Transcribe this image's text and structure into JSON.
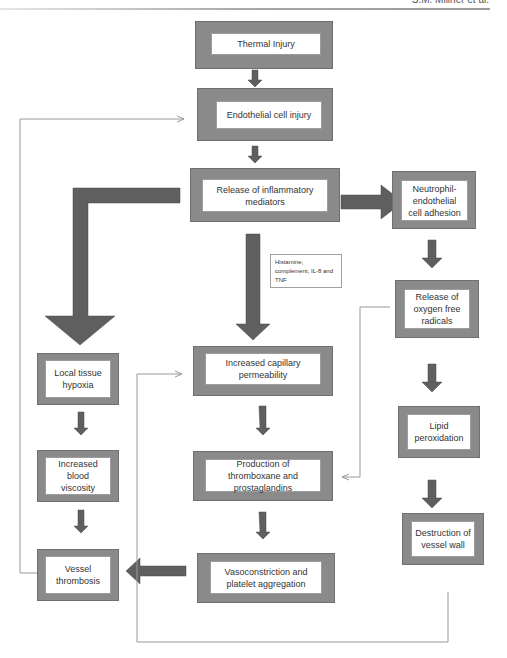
{
  "header": {
    "running_head": "S.M. Millner et al."
  },
  "nodes": {
    "thermal_injury": "Thermal Injury",
    "endothelial_cell_injury": "Endothelial cell injury",
    "release_inflammatory_mediators": "Release of inflammatory mediators",
    "neutrophil_adhesion": "Neutrophil-endothelial cell adhesion",
    "release_oxygen_free_radicals": "Release of oxygen free radicals",
    "local_tissue_hypoxia": "Local tissue hypoxia",
    "increased_capillary_permeability": "Increased capillary permeability",
    "lipid_peroxidation": "Lipid peroxidation",
    "increased_blood_viscosity": "Increased blood viscosity",
    "production_thromboxane": "Production of thromboxane and prostaglandins",
    "destruction_vessel_wall": "Destruction of vessel wall",
    "vessel_thrombosis": "Vessel thrombosis",
    "vasoconstriction": "Vasoconstriction and platelet aggregation"
  },
  "annotations": {
    "mediators_note": "Histamine, complement, IL-8 and TNF"
  },
  "colors": {
    "box_frame": "#8a8a8a",
    "arrow_fill": "#5f5f5f",
    "thin_line": "#9a9a9a"
  }
}
